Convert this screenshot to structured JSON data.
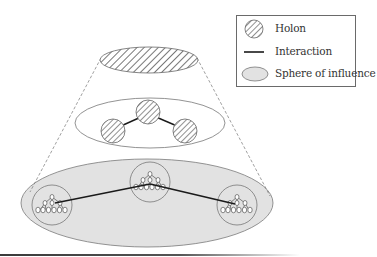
{
  "figure": {
    "colors": {
      "hatch_stroke": "#555555",
      "outline": "#7a7a7a",
      "sphere_fill": "#e2e2e2",
      "interaction_line": "#1a1a1a",
      "cone_dash": "#777777"
    },
    "levels": [
      {
        "name": "top-holon",
        "kind": "hatched-ellipse"
      },
      {
        "name": "middle-level",
        "kind": "ellipse",
        "holons": 3,
        "interactions": 2
      },
      {
        "name": "bottom-level",
        "kind": "sphere-of-influence",
        "holons": 3,
        "interactions": 2,
        "nested_structure": "holarchy-tree"
      }
    ]
  },
  "legend": {
    "items": [
      {
        "icon": "hatched-circle-icon",
        "label": "Holon"
      },
      {
        "icon": "line-icon",
        "label": "Interaction"
      },
      {
        "icon": "gray-ellipse-icon",
        "label": "Sphere of influence"
      }
    ]
  }
}
